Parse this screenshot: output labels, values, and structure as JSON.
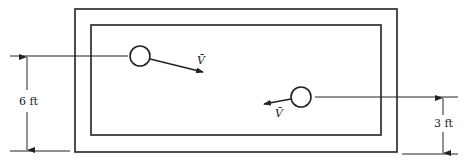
{
  "diagram": {
    "type": "tank-with-jets",
    "stroke_color": "#222222",
    "background": "#ffffff",
    "outer_rect": {
      "x": 75,
      "y": 9,
      "w": 322,
      "h": 143
    },
    "inner_rect": {
      "x": 91,
      "y": 25,
      "w": 290,
      "h": 110
    },
    "jets": [
      {
        "name": "left-jet",
        "circle": {
          "cx": 140,
          "cy": 56,
          "r": 10
        },
        "velocity_label": "V̄",
        "direction": "right-down"
      },
      {
        "name": "right-jet",
        "circle": {
          "cx": 301,
          "cy": 97,
          "r": 10
        },
        "velocity_label": "V̄",
        "direction": "left-down"
      }
    ],
    "dimensions": [
      {
        "name": "left-height",
        "label": "6 ft"
      },
      {
        "name": "right-height",
        "label": "3 ft"
      }
    ]
  }
}
